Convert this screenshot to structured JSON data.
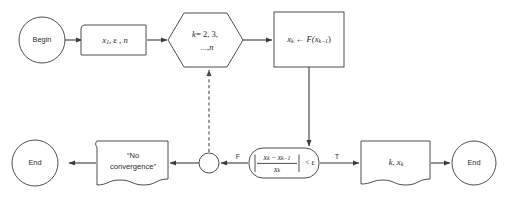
{
  "diagram": {
    "type": "flowchart",
    "stroke_color": "#3a3a3a",
    "background_color": "#ffffff"
  },
  "nodes": {
    "begin": {
      "label": "Begin",
      "shape": "circle"
    },
    "input": {
      "label": "x1, ε, n",
      "shape": "input-box",
      "parts": {
        "x": "x",
        "x_sub": "1",
        "eps": "ε",
        "n": "n",
        "comma": ","
      }
    },
    "loop": {
      "shape": "hexagon",
      "line1_k": "k",
      "line1_eq": "= 2, 3,",
      "line2_dots": "...,",
      "line2_n": "n"
    },
    "process": {
      "shape": "rectangle",
      "lhs": "x",
      "lhs_sub": "k",
      "arrow": "←",
      "fn": "F(x",
      "fn_sub": "k−1",
      "fn_close": ")"
    },
    "decision": {
      "shape": "rounded-rectangle",
      "num_a": "x",
      "num_a_sub": "k",
      "minus": "−",
      "num_b": "x",
      "num_b_sub": "k−1",
      "den": "x",
      "den_sub": "k",
      "cmp": "< ε"
    },
    "junction": {
      "shape": "small-circle",
      "label": ""
    },
    "no_convergence": {
      "label_line1": "“No",
      "label_line2": "convergence”",
      "shape": "document"
    },
    "output": {
      "shape": "document",
      "k": "k",
      "comma": ",",
      "x": "x",
      "x_sub": "k"
    },
    "end_left": {
      "label": "End",
      "shape": "circle"
    },
    "end_right": {
      "label": "End",
      "shape": "circle"
    }
  },
  "edge_labels": {
    "false_branch": "F",
    "true_branch": "T"
  }
}
